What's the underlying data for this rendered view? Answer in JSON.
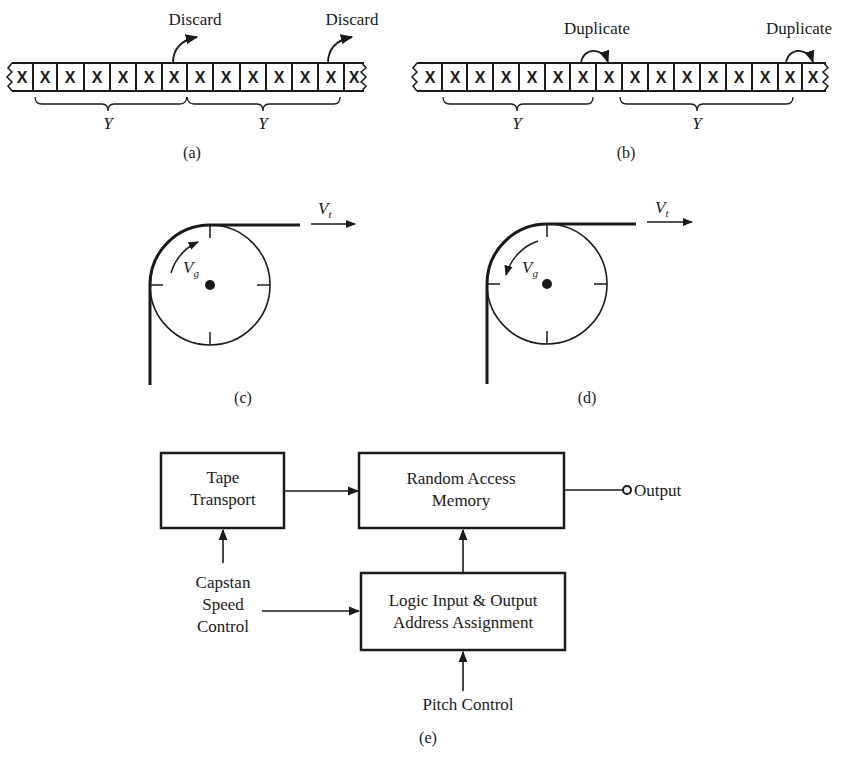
{
  "figure_a": {
    "caption": "(a)",
    "cell_symbol": "X",
    "cell_count": 14,
    "annotations": [
      {
        "label": "Discard",
        "from_cell": 7
      },
      {
        "label": "Discard",
        "from_cell": 13
      }
    ],
    "brace_labels": [
      "Y",
      "Y"
    ]
  },
  "figure_b": {
    "caption": "(b)",
    "cell_symbol": "X",
    "cell_count": 16,
    "annotations": [
      {
        "label": "Duplicate",
        "from_cell": 7
      },
      {
        "label": "Duplicate",
        "from_cell": 15
      }
    ],
    "brace_labels": [
      "Y",
      "Y"
    ]
  },
  "figure_c": {
    "caption": "(c)",
    "tape_velocity_label": "V",
    "tape_velocity_sub": "t",
    "head_velocity_label": "V",
    "head_velocity_sub": "g",
    "rotation": "clockwise"
  },
  "figure_d": {
    "caption": "(d)",
    "tape_velocity_label": "V",
    "tape_velocity_sub": "t",
    "head_velocity_label": "V",
    "head_velocity_sub": "g",
    "rotation": "counter-clockwise"
  },
  "figure_e": {
    "caption": "(e)",
    "blocks": {
      "tape_transport": [
        "Tape",
        "Transport"
      ],
      "ram": [
        "Random Access",
        "Memory"
      ],
      "logic": [
        "Logic Input & Output",
        "Address Assignment"
      ]
    },
    "inputs": {
      "capstan": [
        "Capstan",
        "Speed",
        "Control"
      ],
      "pitch": "Pitch Control"
    },
    "output_label": "Output"
  }
}
